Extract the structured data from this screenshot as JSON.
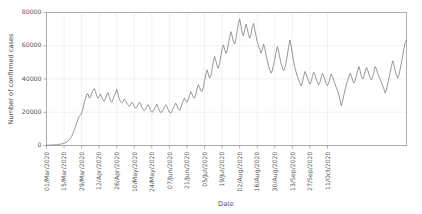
{
  "chart_data": {
    "type": "line",
    "title": "",
    "xlabel": "Date",
    "ylabel": "Number of confirmed cases",
    "ylim": [
      0,
      80000
    ],
    "yticks": [
      0,
      20000,
      40000,
      60000,
      80000
    ],
    "ytick_labels": [
      "0",
      "20000",
      "40000",
      "60000",
      "80000"
    ],
    "grid": true,
    "legend": "none",
    "x_start": "01/Mar/2020",
    "x_end": "15/Oct/2020",
    "x_tick_interval_days": 14,
    "xtick_labels": [
      "01/Mar/2020",
      "15/Mar/2020",
      "29/Mar/2020",
      "12/Apr/2020",
      "26/Apr/2020",
      "10/May/2020",
      "24/May/2020",
      "07/Jun/2020",
      "21/Jun/2020",
      "05/Jul/2020",
      "19/Jul/2020",
      "02/Aug/2020",
      "16/Aug/2020",
      "30/Aug/2020",
      "13/Sep/2020",
      "27/Sep/2020",
      "11/Oct/2020"
    ],
    "series": [
      {
        "name": "Daily confirmed cases",
        "color": "#7d7d7d",
        "values": [
          180,
          200,
          230,
          260,
          300,
          340,
          380,
          430,
          500,
          580,
          680,
          800,
          950,
          1150,
          1400,
          1700,
          2100,
          2600,
          3300,
          4200,
          5400,
          7000,
          9000,
          11200,
          13500,
          15800,
          17500,
          18200,
          19500,
          22000,
          25500,
          28000,
          30800,
          31200,
          28600,
          29000,
          31500,
          33000,
          34200,
          32500,
          30000,
          28500,
          29500,
          31000,
          29000,
          27500,
          26500,
          28000,
          30500,
          31800,
          29500,
          27000,
          26000,
          27500,
          30000,
          31500,
          33800,
          31000,
          28000,
          26500,
          25500,
          26500,
          28000,
          27000,
          25500,
          24500,
          23500,
          24500,
          26000,
          25000,
          23500,
          22500,
          23000,
          24500,
          26000,
          25000,
          23000,
          21500,
          21000,
          22000,
          23500,
          24500,
          23000,
          21000,
          20000,
          20500,
          22000,
          23500,
          24800,
          23000,
          21000,
          19800,
          20200,
          21500,
          23000,
          24500,
          23500,
          21500,
          20000,
          19500,
          20500,
          22500,
          24000,
          25500,
          24000,
          22000,
          21000,
          22500,
          25000,
          27000,
          28500,
          27000,
          26000,
          27500,
          30000,
          32500,
          31000,
          29000,
          28500,
          30500,
          34000,
          36500,
          35000,
          33000,
          32500,
          35000,
          39000,
          42500,
          45500,
          43000,
          40500,
          42000,
          46000,
          50500,
          53500,
          51000,
          48000,
          46500,
          49500,
          54000,
          58000,
          60500,
          58000,
          55500,
          57000,
          61000,
          65000,
          68500,
          66000,
          62500,
          61000,
          64000,
          69000,
          73500,
          76200,
          72000,
          68000,
          66000,
          69500,
          73000,
          70500,
          67000,
          64500,
          66500,
          71000,
          73500,
          70000,
          66000,
          62500,
          60000,
          58000,
          55500,
          57500,
          61000,
          58500,
          54500,
          51000,
          48000,
          45500,
          43500,
          45000,
          48500,
          52000,
          56000,
          59500,
          57000,
          53000,
          49500,
          47000,
          45000,
          46500,
          50000,
          54500,
          59000,
          63500,
          60000,
          55000,
          50500,
          47000,
          44000,
          41500,
          39500,
          37500,
          36000,
          38000,
          41500,
          44500,
          43000,
          40500,
          38500,
          37000,
          38500,
          41500,
          44000,
          42500,
          40000,
          38000,
          36500,
          38000,
          41000,
          43500,
          42000,
          39500,
          37500,
          36000,
          37500,
          40500,
          43000,
          41500,
          39000,
          37000,
          35000,
          33000,
          30500,
          27500,
          24000,
          26500,
          30000,
          33500,
          36500,
          39000,
          41000,
          43500,
          42000,
          39500,
          37500,
          39000,
          42000,
          45000,
          47500,
          45000,
          42000,
          40000,
          41500,
          44500,
          47000,
          45500,
          43000,
          41000,
          39500,
          41000,
          44000,
          47500,
          46000,
          43500,
          41500,
          40000,
          38000,
          36000,
          34000,
          31500,
          33500,
          37000,
          40500,
          44000,
          47500,
          51000,
          48500,
          45000,
          42500,
          40500,
          42500,
          46000,
          50000,
          54000,
          58500,
          62000,
          63500
        ]
      }
    ]
  },
  "axes": {
    "xlabel": "Date",
    "ylabel": "Number of confirmed cases"
  }
}
